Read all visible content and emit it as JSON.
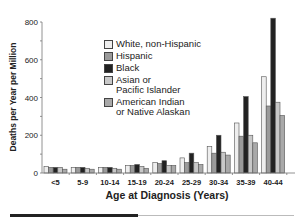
{
  "chart_data": {
    "type": "bar",
    "title": "",
    "xlabel": "Age at Diagnosis (Years)",
    "ylabel": "Deaths per Year per Million",
    "ylim": [
      0,
      800
    ],
    "yticks": [
      0,
      200,
      400,
      600,
      800
    ],
    "grid": false,
    "legend_position": "upper-left-inside",
    "categories": [
      "<5",
      "5-9",
      "10-14",
      "15-19",
      "20-24",
      "25-29",
      "30-34",
      "35-39",
      "40-44"
    ],
    "series": [
      {
        "name": "White, non-Hispanic",
        "color": "#eeeeee",
        "values": [
          35,
          30,
          30,
          40,
          55,
          80,
          140,
          265,
          510
        ]
      },
      {
        "name": "Hispanic",
        "color": "#9a9a9a",
        "values": [
          30,
          30,
          30,
          40,
          50,
          55,
          105,
          195,
          355
        ]
      },
      {
        "name": "Black",
        "color": "#222222",
        "values": [
          30,
          30,
          30,
          45,
          65,
          105,
          200,
          405,
          820
        ]
      },
      {
        "name": "Asian or\nPacific Islander",
        "color": "#c8c8c8",
        "values": [
          30,
          25,
          25,
          35,
          40,
          55,
          110,
          200,
          375
        ]
      },
      {
        "name": "American Indian\nor Native Alaskan",
        "color": "#a9a9a9",
        "values": [
          20,
          20,
          20,
          25,
          40,
          45,
          95,
          160,
          305
        ]
      }
    ]
  }
}
